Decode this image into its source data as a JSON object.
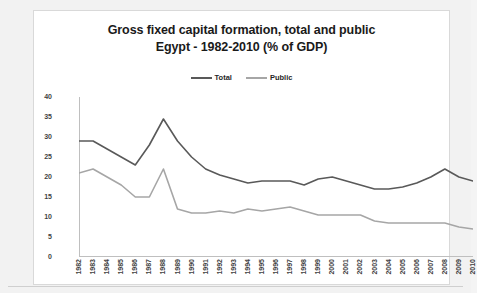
{
  "chart_data": {
    "type": "line",
    "title": "Gross fixed capital formation, total and public\nEgypt - 1982-2010 (% of GDP)",
    "title_line1": "Gross fixed capital formation, total and public",
    "title_line2": "Egypt - 1982-2010 (% of GDP)",
    "xlabel": "",
    "ylabel": "",
    "ylim": [
      0,
      40
    ],
    "yticks": [
      0,
      5,
      10,
      15,
      20,
      25,
      30,
      35,
      40
    ],
    "grid": false,
    "legend_position": "top-center",
    "categories": [
      "1982",
      "1983",
      "1984",
      "1985",
      "1986",
      "1987",
      "1988",
      "1989",
      "1990",
      "1991",
      "1992",
      "1993",
      "1994",
      "1995",
      "1996",
      "1997",
      "1998",
      "1999",
      "2000",
      "2001",
      "2002",
      "2003",
      "2004",
      "2005",
      "2006",
      "2007",
      "2008",
      "2009",
      "2010"
    ],
    "series": [
      {
        "name": "Total",
        "color": "#595959",
        "values": [
          29,
          29,
          27,
          25,
          23,
          28,
          34.5,
          29,
          25,
          22,
          20.5,
          19.5,
          18.5,
          19,
          19,
          19,
          18,
          19.5,
          20,
          19,
          18,
          17,
          17,
          17.5,
          18.5,
          20,
          22,
          20,
          19
        ]
      },
      {
        "name": "Public",
        "color": "#a6a6a6",
        "values": [
          21,
          22,
          20,
          18,
          15,
          15,
          22,
          12,
          11,
          11,
          11.5,
          11,
          12,
          11.5,
          12,
          12.5,
          11.5,
          10.5,
          10.5,
          10.5,
          10.5,
          9,
          8.5,
          8.5,
          8.5,
          8.5,
          8.5,
          7.5,
          7
        ]
      }
    ]
  },
  "legend": {
    "items": [
      {
        "label": "Total",
        "color": "#595959"
      },
      {
        "label": "Public",
        "color": "#a6a6a6"
      }
    ]
  }
}
